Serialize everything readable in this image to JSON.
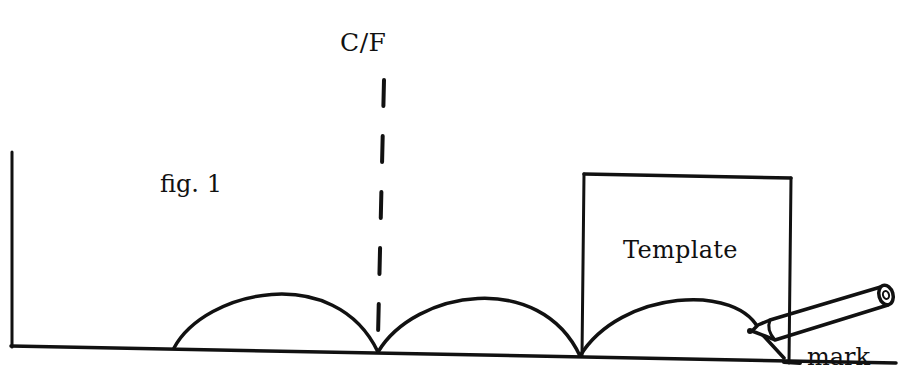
{
  "diagram": {
    "labels": {
      "centre_line": "C/F",
      "figure": "fig. 1",
      "template": "Template",
      "mark": "mark"
    },
    "colors": {
      "ink": "#111111",
      "background": "#ffffff"
    },
    "elements": {
      "baseline": {
        "x1": 12,
        "y1": 346,
        "x2": 895,
        "y2": 363
      },
      "left_wall": {
        "x": 12,
        "y_top": 152,
        "y_bottom": 346
      },
      "centre_line": {
        "x": 380,
        "y_top": 82,
        "y_bottom": 336,
        "style": "dashed"
      },
      "arcs": [
        {
          "from_x": 174,
          "to_x": 378,
          "peak_y": 292
        },
        {
          "from_x": 378,
          "to_x": 580,
          "peak_y": 299
        },
        {
          "from_x": 580,
          "to_x": 785,
          "peak_y": 305
        }
      ],
      "template_box": {
        "x1": 583,
        "y1": 175,
        "x2": 790,
        "y2": 178,
        "bottom_y": 356
      },
      "pencil": {
        "tip_x": 760,
        "tip_y": 330,
        "end_x": 888,
        "end_y": 293
      }
    }
  }
}
